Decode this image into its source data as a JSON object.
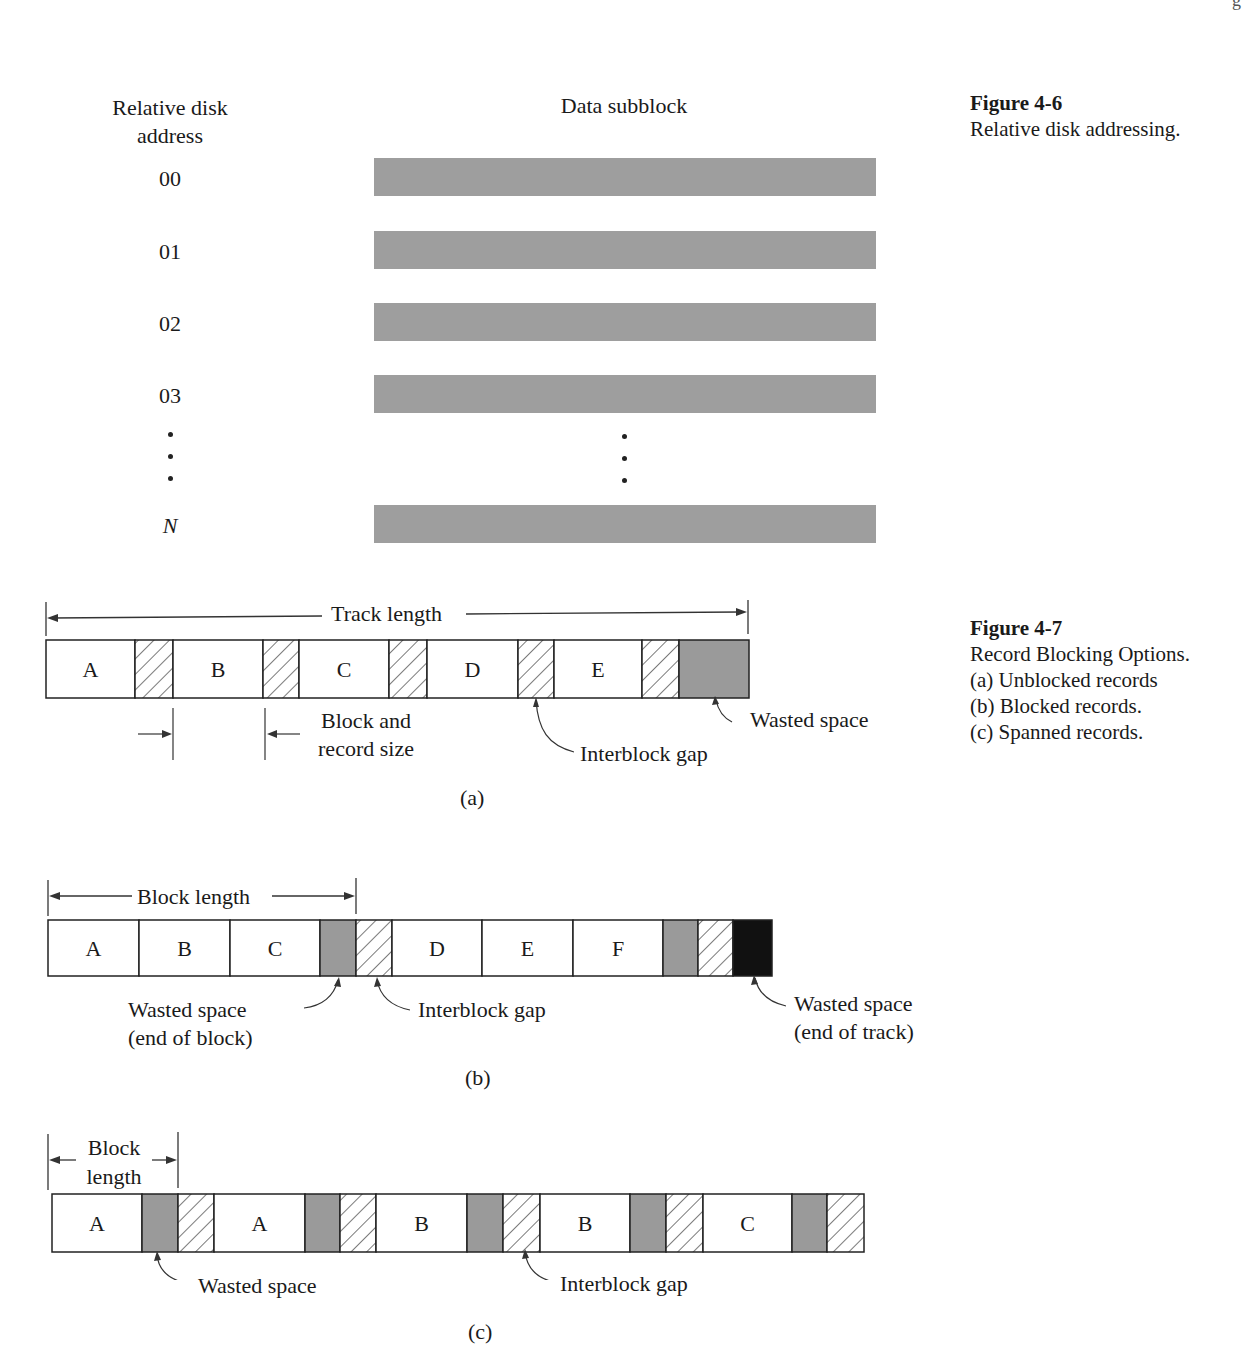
{
  "page": {
    "corner_mark": "g"
  },
  "figure_4_6": {
    "caption_title": "Figure 4-6",
    "caption_text": "Relative disk addressing.",
    "col_address_header_line1": "Relative disk",
    "col_address_header_line2": "address",
    "col_subblock_header": "Data subblock",
    "rows": [
      {
        "address": "00",
        "y": 158
      },
      {
        "address": "01",
        "y": 231
      },
      {
        "address": "02",
        "y": 303
      },
      {
        "address": "03",
        "y": 375
      },
      {
        "address": "N",
        "y": 505,
        "italic": true
      }
    ],
    "ellipsis_left": "•",
    "ellipsis_right": "•",
    "bar_color": "#9e9e9e"
  },
  "figure_4_7": {
    "caption_title": "Figure 4-7",
    "caption_lines": [
      "Record Blocking Options.",
      "(a)  Unblocked records",
      "(b)  Blocked records.",
      "(c)  Spanned records."
    ],
    "colors": {
      "wasted": "#9a9a9a",
      "end_of_track": "#111111",
      "record": "#ffffff",
      "outline": "#222222"
    },
    "panel_a": {
      "label": "(a)",
      "dimension_label": "Track length",
      "size_label_line1": "Block and",
      "size_label_line2": "record size",
      "gap_label": "Interblock gap",
      "waste_label": "Wasted space",
      "segments": [
        {
          "type": "record",
          "label": "A",
          "x": 46,
          "w": 89
        },
        {
          "type": "gap",
          "x": 135,
          "w": 38
        },
        {
          "type": "record",
          "label": "B",
          "x": 173,
          "w": 90
        },
        {
          "type": "gap",
          "x": 263,
          "w": 36
        },
        {
          "type": "record",
          "label": "C",
          "x": 299,
          "w": 90
        },
        {
          "type": "gap",
          "x": 389,
          "w": 38
        },
        {
          "type": "record",
          "label": "D",
          "x": 427,
          "w": 91
        },
        {
          "type": "gap",
          "x": 518,
          "w": 36
        },
        {
          "type": "record",
          "label": "E",
          "x": 554,
          "w": 88
        },
        {
          "type": "gap",
          "x": 642,
          "w": 37
        },
        {
          "type": "wasted",
          "x": 679,
          "w": 70
        }
      ]
    },
    "panel_b": {
      "label": "(b)",
      "dimension_label": "Block length",
      "waste_block_line1": "Wasted space",
      "waste_block_line2": "(end of block)",
      "gap_label": "Interblock gap",
      "waste_track_line1": "Wasted space",
      "waste_track_line2": "(end of track)",
      "segments": [
        {
          "type": "record",
          "label": "A",
          "x": 48,
          "w": 91
        },
        {
          "type": "record",
          "label": "B",
          "x": 139,
          "w": 91
        },
        {
          "type": "record",
          "label": "C",
          "x": 230,
          "w": 90
        },
        {
          "type": "wasted",
          "x": 320,
          "w": 36
        },
        {
          "type": "gap",
          "x": 356,
          "w": 36
        },
        {
          "type": "record",
          "label": "D",
          "x": 392,
          "w": 90
        },
        {
          "type": "record",
          "label": "E",
          "x": 482,
          "w": 91
        },
        {
          "type": "record",
          "label": "F",
          "x": 573,
          "w": 90
        },
        {
          "type": "wasted",
          "x": 663,
          "w": 35
        },
        {
          "type": "gap",
          "x": 698,
          "w": 35
        },
        {
          "type": "end_of_track",
          "x": 733,
          "w": 39
        }
      ]
    },
    "panel_c": {
      "label": "(c)",
      "dimension_label_line1": "Block",
      "dimension_label_line2": "length",
      "waste_label": "Wasted space",
      "gap_label": "Interblock gap",
      "segments": [
        {
          "type": "record",
          "label": "A",
          "x": 52,
          "w": 90
        },
        {
          "type": "wasted",
          "x": 142,
          "w": 36
        },
        {
          "type": "gap",
          "x": 178,
          "w": 36
        },
        {
          "type": "record",
          "label": "A",
          "x": 214,
          "w": 91
        },
        {
          "type": "wasted",
          "x": 305,
          "w": 35
        },
        {
          "type": "gap",
          "x": 340,
          "w": 36
        },
        {
          "type": "record",
          "label": "B",
          "x": 376,
          "w": 91
        },
        {
          "type": "wasted",
          "x": 467,
          "w": 36
        },
        {
          "type": "gap",
          "x": 503,
          "w": 37
        },
        {
          "type": "record",
          "label": "B",
          "x": 540,
          "w": 90
        },
        {
          "type": "wasted",
          "x": 630,
          "w": 36
        },
        {
          "type": "gap",
          "x": 666,
          "w": 37
        },
        {
          "type": "record",
          "label": "C",
          "x": 703,
          "w": 89
        },
        {
          "type": "wasted",
          "x": 792,
          "w": 35
        },
        {
          "type": "gap",
          "x": 827,
          "w": 37
        }
      ]
    }
  }
}
